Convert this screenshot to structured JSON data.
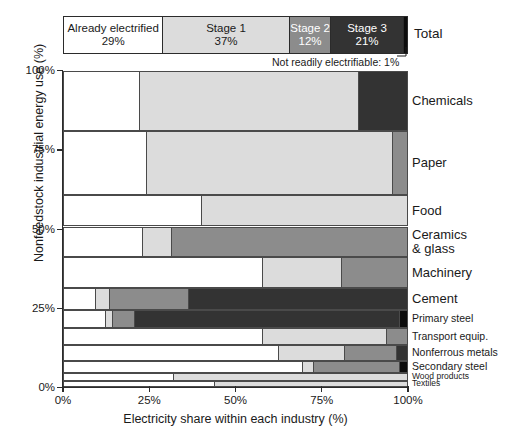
{
  "legend": {
    "total_label": "Total",
    "footnote": "Not readily electrifiable: 1%",
    "segments": [
      {
        "name": "Already electrified",
        "value": "29%",
        "pct": 29,
        "color": "#ffffff",
        "dark": false
      },
      {
        "name": "Stage 1",
        "value": "37%",
        "pct": 37,
        "color": "#dcdcdc",
        "dark": false
      },
      {
        "name": "Stage 2",
        "value": "12%",
        "pct": 12,
        "color": "#8c8c8c",
        "dark": true
      },
      {
        "name": "Stage 3",
        "value": "21%",
        "pct": 21,
        "color": "#333333",
        "dark": true
      },
      {
        "name": "Not readily electrifiable",
        "value": "1%",
        "pct": 1,
        "color": "#0d0d0d",
        "dark": true
      }
    ]
  },
  "axes": {
    "y_title": "Nonfeedstock industrial energy use (%)",
    "x_title": "Electricity share within each industry (%)",
    "y_ticks": [
      "100%",
      "75%",
      "50%",
      "25%",
      "0%"
    ],
    "y_tick_values": [
      100,
      75,
      50,
      25,
      0
    ],
    "x_ticks": [
      "0%",
      "25%",
      "50%",
      "75%",
      "100%"
    ],
    "x_tick_values": [
      0,
      25,
      50,
      75,
      100
    ]
  },
  "colors": {
    "already_electrified": "#ffffff",
    "stage1": "#dcdcdc",
    "stage2": "#8c8c8c",
    "stage3": "#333333",
    "not_electrifiable": "#0d0d0d",
    "outline": "#4a4a4a",
    "axis": "#2b2b2b",
    "text": "#1a1a1a"
  },
  "chart_data": {
    "type": "bar",
    "subtype": "marimekko",
    "title": "",
    "xlabel": "Electricity share within each industry (%)",
    "ylabel": "Nonfeedstock industrial energy use (%)",
    "xlim": [
      0,
      100
    ],
    "ylim": [
      0,
      100
    ],
    "grid": false,
    "legend_position": "top",
    "series": [
      {
        "name": "Already electrified",
        "color": "#ffffff"
      },
      {
        "name": "Stage 1",
        "color": "#dcdcdc"
      },
      {
        "name": "Stage 2",
        "color": "#8c8c8c"
      },
      {
        "name": "Stage 3",
        "color": "#333333"
      },
      {
        "name": "Not readily electrifiable",
        "color": "#0d0d0d"
      }
    ],
    "totals": {
      "already_electrified": 29,
      "stage1": 37,
      "stage2": 12,
      "stage3": 21,
      "not_electrifiable": 1
    },
    "categories": [
      "Chemicals",
      "Paper",
      "Food",
      "Ceramics & glass",
      "Machinery",
      "Cement",
      "Primary steel",
      "Transport equip.",
      "Nonferrous metals",
      "Secondary steel",
      "Wood products",
      "Textiles"
    ],
    "rows": [
      {
        "label": "Chemicals",
        "label_html": "Chemicals",
        "height_pct": 19.3,
        "shares": [
          22,
          64,
          0,
          14,
          0
        ]
      },
      {
        "label": "Paper",
        "label_html": "Paper",
        "height_pct": 20.3,
        "shares": [
          24,
          72,
          4,
          0,
          0
        ]
      },
      {
        "label": "Food",
        "label_html": "Food",
        "height_pct": 10.1,
        "shares": [
          40,
          60,
          0,
          0,
          0
        ]
      },
      {
        "label": "Ceramics & glass",
        "label_html": "Ceramics|& glass",
        "height_pct": 9.8,
        "shares": [
          23,
          8,
          69,
          0,
          0
        ]
      },
      {
        "label": "Machinery",
        "label_html": "Machinery",
        "height_pct": 9.8,
        "shares": [
          58,
          23,
          19,
          0,
          0
        ]
      },
      {
        "label": "Cement",
        "label_html": "Cement",
        "height_pct": 7.0,
        "shares": [
          9,
          4,
          23,
          64,
          0
        ]
      },
      {
        "label": "Primary steel",
        "label_html": "Primary steel",
        "height_pct": 6.0,
        "shares": [
          12,
          2,
          6,
          78,
          2
        ]
      },
      {
        "label": "Transport equip.",
        "label_html": "Transport equip.",
        "height_pct": 5.4,
        "shares": [
          58,
          36,
          6,
          0,
          0
        ]
      },
      {
        "label": "Nonferrous metals",
        "label_html": "Nonferrous metals",
        "height_pct": 5.1,
        "shares": [
          63,
          19,
          15,
          3,
          0
        ]
      },
      {
        "label": "Secondary steel",
        "label_html": "Secondary steel",
        "height_pct": 3.8,
        "shares": [
          70,
          3,
          25,
          0,
          2
        ]
      },
      {
        "label": "Wood products",
        "label_html": "Wood products",
        "height_pct": 2.5,
        "shares": [
          32,
          68,
          0,
          0,
          0
        ]
      },
      {
        "label": "Textiles",
        "label_html": "Textiles",
        "height_pct": 1.9,
        "shares": [
          44,
          56,
          0,
          0,
          0
        ]
      }
    ]
  }
}
